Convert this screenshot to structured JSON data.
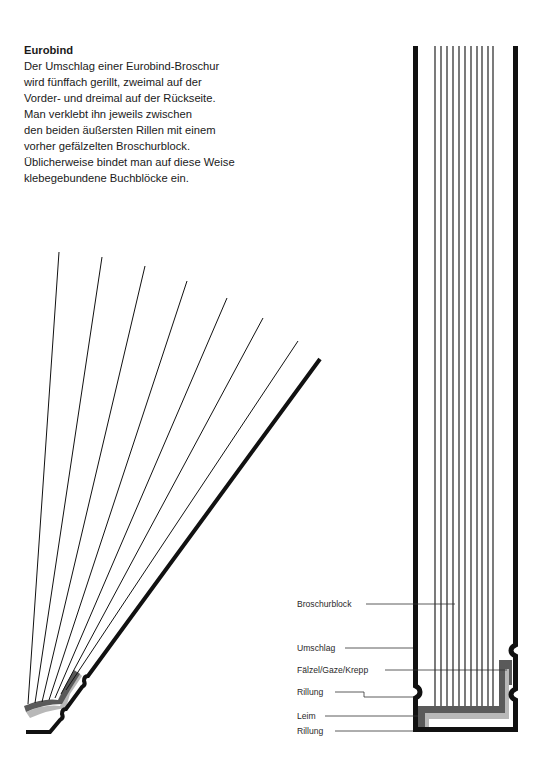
{
  "intro": {
    "title": "Eurobind",
    "lines": [
      "Der Umschlag einer Eurobind-Broschur",
      "wird fünffach gerillt, zweimal auf der",
      "Vorder- und dreimal auf der Rückseite.",
      "Man verklebt ihn jeweils zwischen",
      "den beiden äußersten Rillen mit einem",
      "vorher gefälzelten Broschurblock.",
      "Üblicherweise bindet man auf diese Weise",
      "klebegebundene Buchblöcke ein."
    ]
  },
  "labels": {
    "broschurblock": "Broschurblock",
    "umschlag": "Umschlag",
    "faelzel": "Fälzel/Gaze/Krepp",
    "rillung_1": "Rillung",
    "leim": "Leim",
    "rillung_2": "Rillung"
  },
  "colors": {
    "ink": "#111111",
    "leim_dark": "#5a5a5a",
    "faelzel_light": "#b8b8b8",
    "leader": "#333333"
  },
  "diagram": {
    "page_count_lines": 11,
    "fan_page_lines": 7
  }
}
